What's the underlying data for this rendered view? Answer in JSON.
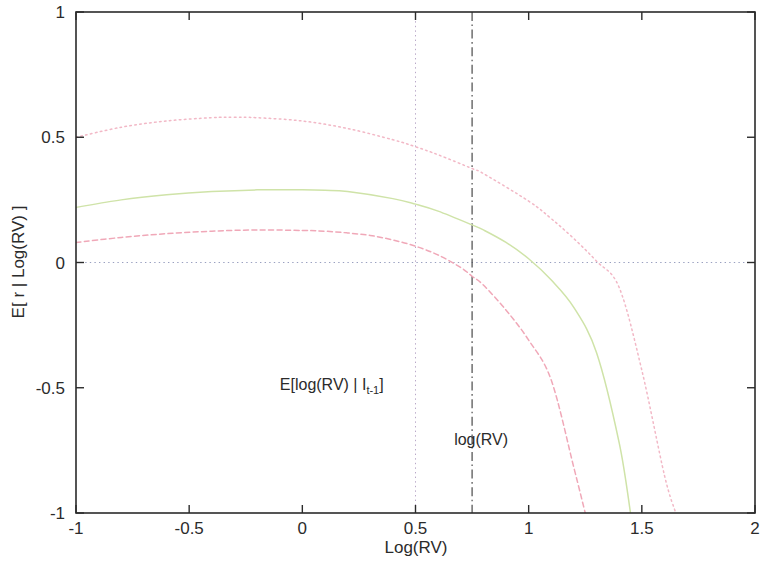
{
  "chart_data": {
    "type": "line",
    "title": "",
    "xlabel": "Log(RV)",
    "ylabel": "E[ r | Log(RV) ]",
    "xlim": [
      -1,
      2
    ],
    "ylim": [
      -1,
      1
    ],
    "xticks": [
      "-1",
      "-0.5",
      "0",
      "0.5",
      "1",
      "1.5",
      "2"
    ],
    "xtick_values": [
      -1,
      -0.5,
      0,
      0.5,
      1,
      1.5,
      2
    ],
    "yticks": [
      "-1",
      "-0.5",
      "0",
      "0.5",
      "1"
    ],
    "ytick_values": [
      -1,
      -0.5,
      0,
      0.5,
      1
    ],
    "grid": false,
    "legend": "none",
    "series": [
      {
        "name": "upper-band",
        "style": "dotted",
        "color": "#f2b8c6",
        "x": [
          -1.0,
          -0.8,
          -0.6,
          -0.4,
          -0.3,
          -0.2,
          0.0,
          0.2,
          0.4,
          0.5,
          0.6,
          0.75,
          0.8,
          1.0,
          1.1,
          1.2,
          1.3,
          1.4,
          1.5,
          1.6,
          1.65
        ],
        "y": [
          0.5,
          0.54,
          0.565,
          0.578,
          0.58,
          0.578,
          0.565,
          0.535,
          0.49,
          0.462,
          0.43,
          0.375,
          0.355,
          0.245,
          0.175,
          0.095,
          0.005,
          -0.1,
          -0.43,
          -0.85,
          -1.0
        ]
      },
      {
        "name": "mean-curve",
        "style": "solid",
        "color": "#cfe3a8",
        "x": [
          -1.0,
          -0.8,
          -0.6,
          -0.4,
          -0.2,
          0.0,
          0.1,
          0.2,
          0.4,
          0.5,
          0.6,
          0.75,
          0.8,
          0.9,
          1.0,
          1.1,
          1.2,
          1.3,
          1.4,
          1.45
        ],
        "y": [
          0.22,
          0.25,
          0.27,
          0.283,
          0.29,
          0.29,
          0.288,
          0.283,
          0.255,
          0.233,
          0.205,
          0.15,
          0.13,
          0.08,
          0.015,
          -0.07,
          -0.18,
          -0.36,
          -0.72,
          -1.0
        ]
      },
      {
        "name": "lower-band",
        "style": "dashed",
        "color": "#f0a8b8",
        "x": [
          -1.0,
          -0.8,
          -0.6,
          -0.4,
          -0.2,
          0.0,
          0.1,
          0.2,
          0.3,
          0.4,
          0.5,
          0.6,
          0.7,
          0.75,
          0.8,
          0.9,
          1.0,
          1.1,
          1.2,
          1.25
        ],
        "y": [
          0.08,
          0.1,
          0.115,
          0.125,
          0.13,
          0.128,
          0.125,
          0.118,
          0.108,
          0.09,
          0.065,
          0.03,
          -0.02,
          -0.055,
          -0.09,
          -0.19,
          -0.31,
          -0.47,
          -0.82,
          -1.0
        ]
      }
    ],
    "reference_lines": [
      {
        "name": "zero-line",
        "orientation": "horizontal",
        "value": 0,
        "style": "dotted",
        "color": "#9aa0c0"
      },
      {
        "name": "expected-log-rv-line",
        "orientation": "vertical",
        "value": 0.5,
        "style": "dotted",
        "color": "#b9a8c8"
      },
      {
        "name": "log-rv-line",
        "orientation": "vertical",
        "value": 0.75,
        "style": "dashdot",
        "color": "#3a3a3a"
      }
    ],
    "annotations": [
      {
        "name": "expected-log-rv-annotation",
        "text": "E[log(RV) | I",
        "subscript": "t-1",
        "text_tail": "]",
        "x": 0.13,
        "y": -0.51
      },
      {
        "name": "log-rv-annotation",
        "text": "log(RV)",
        "subscript": "",
        "text_tail": "",
        "x": 0.79,
        "y": -0.73
      }
    ]
  }
}
